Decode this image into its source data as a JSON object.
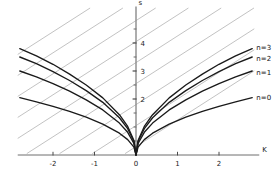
{
  "chart_data": {
    "type": "line",
    "title": "",
    "xlabel": "K",
    "ylabel": "s",
    "xlim": [
      -2.85,
      2.85
    ],
    "ylim": [
      0,
      5.0
    ],
    "grid": false,
    "legend_position": "right-inline",
    "xticks": [
      -2,
      -1,
      0,
      1,
      2
    ],
    "xtick_labels": [
      "-2",
      "-1",
      "0",
      "1",
      "2"
    ],
    "yticks": [
      2,
      3,
      4
    ],
    "ytick_labels": [
      "2",
      "3",
      "4"
    ],
    "yticks_minor": [
      0.5,
      1,
      1.5,
      2.5,
      3.5,
      4.5
    ],
    "series": [
      {
        "name": "n=0",
        "label": "n=0",
        "color": "#1a1a1a",
        "x": [
          -2.8,
          -2.4,
          -2.0,
          -1.6,
          -1.2,
          -0.8,
          -0.4,
          -0.2,
          -0.05,
          0,
          0.05,
          0.2,
          0.4,
          0.8,
          1.2,
          1.6,
          2.0,
          2.4,
          2.8
        ],
        "y": [
          2.05,
          1.9,
          1.74,
          1.56,
          1.35,
          1.1,
          0.78,
          0.55,
          0.28,
          0,
          0.28,
          0.55,
          0.78,
          1.1,
          1.35,
          1.56,
          1.74,
          1.9,
          2.05
        ]
      },
      {
        "name": "n=1",
        "label": "n=1",
        "color": "#1a1a1a",
        "x": [
          -2.8,
          -2.4,
          -2.0,
          -1.6,
          -1.2,
          -0.8,
          -0.4,
          -0.2,
          -0.05,
          0,
          0.05,
          0.2,
          0.4,
          0.8,
          1.2,
          1.6,
          2.0,
          2.4,
          2.8
        ],
        "y": [
          3.0,
          2.79,
          2.55,
          2.28,
          1.97,
          1.61,
          1.14,
          0.81,
          0.41,
          0,
          0.41,
          0.81,
          1.14,
          1.61,
          1.97,
          2.28,
          2.55,
          2.79,
          3.0
        ]
      },
      {
        "name": "n=2",
        "label": "n=2",
        "color": "#1a1a1a",
        "x": [
          -2.8,
          -2.4,
          -2.0,
          -1.6,
          -1.2,
          -0.8,
          -0.4,
          -0.2,
          -0.05,
          0,
          0.05,
          0.2,
          0.4,
          0.8,
          1.2,
          1.6,
          2.0,
          2.4,
          2.8
        ],
        "y": [
          3.5,
          3.26,
          2.98,
          2.66,
          2.3,
          1.88,
          1.33,
          0.94,
          0.48,
          0,
          0.48,
          0.94,
          1.33,
          1.88,
          2.3,
          2.66,
          2.98,
          3.26,
          3.5
        ]
      },
      {
        "name": "n=3",
        "label": "n=3",
        "color": "#1a1a1a",
        "x": [
          -2.8,
          -2.4,
          -2.0,
          -1.6,
          -1.2,
          -0.8,
          -0.4,
          -0.2,
          -0.05,
          0,
          0.05,
          0.2,
          0.4,
          0.8,
          1.2,
          1.6,
          2.0,
          2.4,
          2.8
        ],
        "y": [
          3.8,
          3.54,
          3.24,
          2.89,
          2.5,
          2.04,
          1.44,
          1.02,
          0.52,
          0,
          0.52,
          1.02,
          1.44,
          2.04,
          2.5,
          2.89,
          3.24,
          3.54,
          3.8
        ]
      }
    ],
    "background_lines": {
      "description": "family of parallel gray diagonal lines of positive slope",
      "color": "#a8a8a8",
      "slope": 0.95,
      "count": 9,
      "intercepts": [
        5.55,
        4.8,
        4.05,
        3.3,
        2.55,
        1.8,
        1.05,
        0.3,
        6.3
      ]
    },
    "annotations": [
      {
        "text": "n=3",
        "x": 2.9,
        "y": 3.85
      },
      {
        "text": "n=2",
        "x": 2.9,
        "y": 3.45
      },
      {
        "text": "n=1",
        "x": 2.9,
        "y": 2.95
      },
      {
        "text": "n=0",
        "x": 2.9,
        "y": 2.05
      }
    ]
  },
  "axes": {
    "x_axis_label": "K",
    "y_axis_label": "s"
  }
}
